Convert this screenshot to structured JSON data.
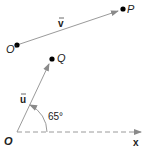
{
  "diagram": {
    "points": {
      "O_prime": {
        "label": "O′",
        "x": 17,
        "y": 45
      },
      "P": {
        "label": "P",
        "x": 123,
        "y": 9
      },
      "Q": {
        "label": "Q",
        "x": 52,
        "y": 59
      },
      "O": {
        "label": "O",
        "x": 17,
        "y": 132
      }
    },
    "vectors": {
      "v": {
        "label": "v",
        "from": "O_prime",
        "to": "P"
      },
      "u": {
        "label": "u",
        "from": "O",
        "to": "Q"
      }
    },
    "axis": {
      "label": "x",
      "style": "dashed"
    },
    "angle": {
      "label": "65°",
      "value": 65
    },
    "colors": {
      "line": "#9a9a9a",
      "dot": "#000000",
      "text": "#222222"
    }
  }
}
